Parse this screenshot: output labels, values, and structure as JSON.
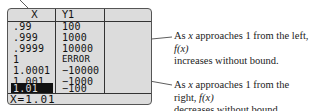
{
  "table": {
    "headers": {
      "x": "X",
      "y": "Y1"
    },
    "rows": [
      {
        "x": ".99",
        "y": "100"
      },
      {
        "x": ".999",
        "y": "1000"
      },
      {
        "x": ".9999",
        "y": "10000"
      },
      {
        "x": "1",
        "y": "ERROR"
      },
      {
        "x": "1.0001",
        "y": "−10000"
      },
      {
        "x": "1.001",
        "y": "−1000"
      },
      {
        "x": "1.01",
        "y": "−100"
      }
    ],
    "selected_row": 6,
    "status": "X=1.01"
  },
  "annotations": {
    "left": {
      "pre": "As ",
      "var": "x",
      "mid": " approaches 1 from the left, ",
      "fn": "f(x)",
      "line2": "increases without bound."
    },
    "right": {
      "pre": "As ",
      "var": "x",
      "mid": " approaches 1 from the right, ",
      "fn": "f(x)",
      "line2": "decreases without bound."
    }
  },
  "colors": {
    "screen_bg": "#dcdcdc",
    "border": "#555555",
    "text": "#111111"
  }
}
